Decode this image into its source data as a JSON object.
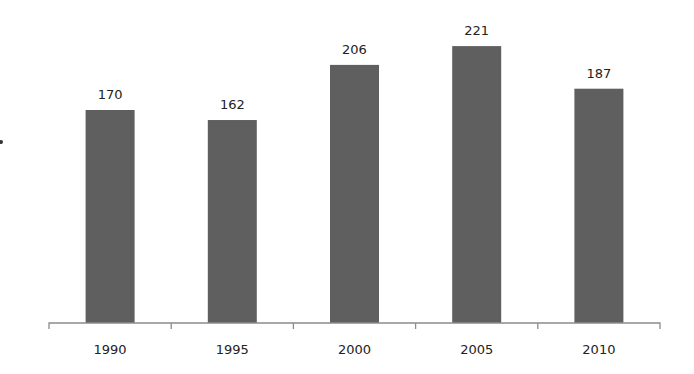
{
  "chart_data": {
    "type": "bar",
    "title": "",
    "xlabel": "",
    "ylabel": "",
    "categories": [
      "1990",
      "1995",
      "2000",
      "2005",
      "2010"
    ],
    "values": [
      170,
      162,
      206,
      221,
      187
    ],
    "data_labels": [
      "170",
      "162",
      "206",
      "221",
      "187"
    ],
    "ylim": [
      0,
      250
    ],
    "grid": false,
    "legend": "none",
    "bar_color": "#5f5f5f"
  }
}
